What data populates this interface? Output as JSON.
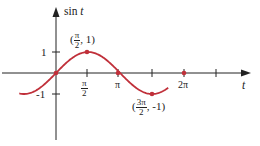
{
  "chart_data": {
    "type": "line",
    "title": "",
    "xlabel": "t",
    "ylabel": "sin t",
    "function": "sin(t)",
    "x_range": [
      -1.8,
      5.5
    ],
    "ylim": [
      -1,
      1
    ],
    "grid": false,
    "legend": null,
    "x_ticks": [
      {
        "value": 1.5708,
        "label": "π/2"
      },
      {
        "value": 3.1416,
        "label": "π"
      },
      {
        "value": 4.7124,
        "label": "3π/2",
        "unlabeled": true
      },
      {
        "value": 6.2832,
        "label": "2π"
      },
      {
        "value": 7.854,
        "label": "",
        "unlabeled": true
      }
    ],
    "y_ticks": [
      {
        "value": 1,
        "label": "1"
      },
      {
        "value": -1,
        "label": "-1"
      }
    ],
    "annotations": [
      {
        "x": 1.5708,
        "y": 1,
        "label": "(π/2, 1)"
      },
      {
        "x": 4.7124,
        "y": -1,
        "label": "(3π/2, -1)"
      }
    ],
    "marked_points": [
      {
        "x": 0,
        "y": 0
      },
      {
        "x": 1.5708,
        "y": 1
      },
      {
        "x": 3.1416,
        "y": 0
      },
      {
        "x": 4.7124,
        "y": -1
      },
      {
        "x": 6.2832,
        "y": 0
      }
    ],
    "colors": {
      "curve": "#c0303a",
      "axis": "#222222"
    }
  },
  "labels": {
    "y_axis": "sin",
    "y_axis_var": "t",
    "x_axis": "t",
    "y_tick_1": "1",
    "y_tick_neg1": "-1",
    "x_tick_pi_half_num": "π",
    "x_tick_pi_half_den": "2",
    "x_tick_pi": "π",
    "x_tick_2pi": "2π",
    "peak_open": "(",
    "peak_num": "π",
    "peak_den": "2",
    "peak_rest": ", 1)",
    "trough_open": "(",
    "trough_num": "3π",
    "trough_den": "2",
    "trough_rest": ", -1)"
  }
}
